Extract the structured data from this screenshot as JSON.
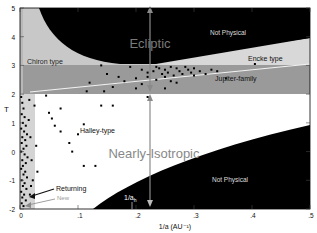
{
  "chart_data": {
    "type": "scatter",
    "title": "",
    "xlabel": "1/a (AU⁻¹)",
    "ylabel": "T",
    "xlim": [
      0,
      0.5
    ],
    "ylim": [
      -2,
      5
    ],
    "x_ticks": [
      {
        "value": 0,
        "label": "0"
      },
      {
        "value": 0.1,
        "label": ".1"
      },
      {
        "value": 0.2,
        "label": ".2"
      },
      {
        "value": 0.3,
        "label": ".3"
      },
      {
        "value": 0.4,
        "label": ".4"
      },
      {
        "value": 0.5,
        "label": ".5"
      }
    ],
    "y_ticks": [
      {
        "value": 5,
        "label": "5"
      },
      {
        "value": 4,
        "label": "4"
      },
      {
        "value": 3,
        "label": "3"
      },
      {
        "value": 2,
        "label": "2"
      },
      {
        "value": 1,
        "label": "1"
      },
      {
        "value": 0,
        "label": "0"
      },
      {
        "value": -1,
        "label": "-1"
      },
      {
        "value": -2,
        "label": "-2"
      }
    ],
    "grid": false,
    "regions": [
      {
        "name": "Not Physical (upper)",
        "fill": "#000000"
      },
      {
        "name": "Not Physical (lower)",
        "fill": "#000000"
      },
      {
        "name": "Chiron type",
        "fill": "#c8c8c8"
      },
      {
        "name": "Encke type",
        "fill": "#d8d8d8"
      },
      {
        "name": "Jupiter-family",
        "fill": "#9a9a9a"
      },
      {
        "name": "Halley-type",
        "fill": "#ffffff"
      },
      {
        "name": "Returning/New strip",
        "fill": "#d4d4d4"
      }
    ],
    "annotations": [
      {
        "text": "Ecliptic",
        "x": 0.225,
        "y": 4.0
      },
      {
        "text": "Nearly-Isotropic",
        "x": 0.225,
        "y": -0.4
      },
      {
        "text": "Not Physical",
        "x": 0.36,
        "y": 4.65
      },
      {
        "text": "Not Physical",
        "x": 0.36,
        "y": -1.1
      },
      {
        "text": "Chiron type",
        "x": 0.05,
        "y": 3.25
      },
      {
        "text": "Encke type",
        "x": 0.43,
        "y": 3.35
      },
      {
        "text": "Jupiter-family",
        "x": 0.42,
        "y": 2.7
      },
      {
        "text": "Halley-type",
        "x": 0.11,
        "y": 0.9
      },
      {
        "text": "Returning",
        "x": 0.1,
        "y": -1.55
      },
      {
        "text": "New",
        "x": 0.1,
        "y": -1.8
      },
      {
        "text": "1/a_h",
        "x": 0.195,
        "y": -1.7
      }
    ],
    "reference_lines": [
      {
        "name": "1/a_h",
        "x": 0.225,
        "orientation": "vertical",
        "from_y": -2,
        "to_y": 5
      }
    ],
    "series": [
      {
        "name": "Jupiter-family comets",
        "points": [
          [
            0.14,
            3.0
          ],
          [
            0.19,
            2.95
          ],
          [
            0.21,
            2.85
          ],
          [
            0.22,
            2.75
          ],
          [
            0.23,
            2.8
          ],
          [
            0.235,
            2.95
          ],
          [
            0.24,
            2.9
          ],
          [
            0.245,
            2.7
          ],
          [
            0.25,
            2.85
          ],
          [
            0.255,
            2.75
          ],
          [
            0.26,
            2.95
          ],
          [
            0.265,
            2.65
          ],
          [
            0.27,
            2.9
          ],
          [
            0.275,
            2.8
          ],
          [
            0.28,
            2.7
          ],
          [
            0.285,
            2.95
          ],
          [
            0.29,
            2.85
          ],
          [
            0.295,
            2.75
          ],
          [
            0.3,
            2.9
          ],
          [
            0.31,
            2.8
          ],
          [
            0.32,
            2.7
          ],
          [
            0.33,
            2.85
          ],
          [
            0.17,
            2.6
          ],
          [
            0.18,
            2.45
          ],
          [
            0.2,
            2.55
          ],
          [
            0.21,
            2.35
          ],
          [
            0.235,
            2.5
          ],
          [
            0.25,
            2.6
          ],
          [
            0.27,
            2.4
          ],
          [
            0.2,
            2.2
          ],
          [
            0.16,
            2.25
          ],
          [
            0.22,
            2.6
          ],
          [
            0.3,
            2.65
          ],
          [
            0.26,
            2.45
          ],
          [
            0.34,
            2.8
          ],
          [
            0.355,
            2.55
          ],
          [
            0.405,
            3.05
          ],
          [
            0.25,
            2.2
          ],
          [
            0.12,
            2.4
          ],
          [
            0.15,
            2.7
          ],
          [
            0.145,
            2.1
          ],
          [
            0.115,
            2.1
          ]
        ]
      },
      {
        "name": "Halley-type comets",
        "points": [
          [
            0.045,
            1.95
          ],
          [
            0.055,
            1.15
          ],
          [
            0.06,
            0.9
          ],
          [
            0.07,
            0.7
          ],
          [
            0.1,
            0.6
          ],
          [
            0.085,
            0.3
          ],
          [
            0.09,
            0.0
          ],
          [
            0.11,
            -0.5
          ],
          [
            0.13,
            -0.5
          ],
          [
            0.05,
            1.35
          ],
          [
            0.07,
            1.5
          ],
          [
            0.14,
            1.6
          ],
          [
            0.16,
            1.6
          ],
          [
            0.22,
            1.9
          ],
          [
            0.11,
            0.95
          ]
        ]
      },
      {
        "name": "Returning / New comets (near 1/a = 0)",
        "points": [
          [
            0.002,
            1.9
          ],
          [
            0.004,
            1.7
          ],
          [
            0.006,
            1.5
          ],
          [
            0.003,
            1.3
          ],
          [
            0.008,
            1.2
          ],
          [
            0.005,
            1.0
          ],
          [
            0.01,
            0.9
          ],
          [
            0.002,
            0.8
          ],
          [
            0.007,
            0.7
          ],
          [
            0.012,
            0.6
          ],
          [
            0.004,
            0.5
          ],
          [
            0.009,
            0.4
          ],
          [
            0.003,
            0.3
          ],
          [
            0.011,
            0.2
          ],
          [
            0.006,
            0.1
          ],
          [
            0.002,
            0.0
          ],
          [
            0.008,
            -0.1
          ],
          [
            0.013,
            -0.2
          ],
          [
            0.004,
            -0.3
          ],
          [
            0.01,
            -0.4
          ],
          [
            0.005,
            -0.5
          ],
          [
            0.002,
            -0.6
          ],
          [
            0.009,
            -0.7
          ],
          [
            0.006,
            -0.8
          ],
          [
            0.012,
            -0.9
          ],
          [
            0.003,
            -1.0
          ],
          [
            0.008,
            -1.1
          ],
          [
            0.005,
            -1.2
          ],
          [
            0.011,
            -1.3
          ],
          [
            0.002,
            -1.4
          ],
          [
            0.007,
            -1.5
          ],
          [
            0.004,
            -1.6
          ],
          [
            0.01,
            -1.7
          ],
          [
            0.003,
            -1.8
          ],
          [
            0.006,
            -1.9
          ],
          [
            0.015,
            1.1
          ],
          [
            0.018,
            0.5
          ],
          [
            0.02,
            -0.3
          ],
          [
            0.022,
            -1.0
          ],
          [
            0.017,
            -1.5
          ],
          [
            0.025,
            1.6
          ],
          [
            0.028,
            0.2
          ],
          [
            0.03,
            -0.7
          ],
          [
            0.016,
            1.8
          ],
          [
            0.019,
            -1.2
          ]
        ]
      }
    ]
  },
  "labels": {
    "ecliptic": "Ecliptic",
    "nearly_isotropic": "Nearly-Isotropic",
    "not_physical_upper": "Not Physical",
    "not_physical_lower": "Not Physical",
    "chiron": "Chiron type",
    "encke": "Encke type",
    "jupiter": "Jupiter-family",
    "halley": "Halley-type",
    "returning": "Returning",
    "new": "New",
    "one_over_ah": "1/a",
    "one_over_ah_sub": "h",
    "xlabel": "1/a  (AU⁻¹)",
    "ylabel": "T",
    "x0": "0",
    "x1": ".1",
    "x2": ".2",
    "x3": ".3",
    "x4": ".4",
    "x5": ".5",
    "y5": "5",
    "y4": "4",
    "y3": "3",
    "y2": "2",
    "y1": "1",
    "y0": "0",
    "ym1": "-1",
    "ym2": "-2"
  }
}
